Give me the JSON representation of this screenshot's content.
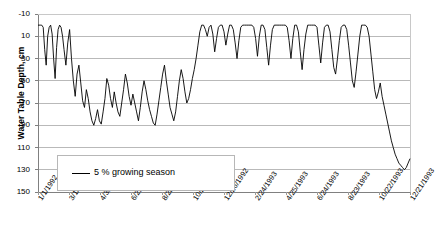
{
  "chart_data": {
    "type": "line",
    "title": "",
    "xlabel": "",
    "ylabel": "Water Table Depth, cm",
    "ylim": [
      -10,
      150
    ],
    "y_inverted": true,
    "ytick_values": [
      -10,
      10,
      30,
      50,
      70,
      90,
      110,
      130,
      150
    ],
    "ytick_labels": [
      "-10",
      "10",
      "30",
      "50",
      "70",
      "90",
      "110",
      "130",
      "150"
    ],
    "grid": "horizontal",
    "legend_position": "lower-left-inside",
    "legend": [
      {
        "name": "5 % growing season",
        "color": "#000000",
        "marker": "line"
      }
    ],
    "xtick_labels": [
      "1/1/1992",
      "3/1/1992",
      "4/30/1992",
      "6/29/1992",
      "8/28/1992",
      "10/27/1992",
      "12/26/1992",
      "2/24/1993",
      "4/25/1993",
      "6/24/1993",
      "8/23/1993",
      "10/22/1993",
      "12/21/1993"
    ],
    "x_axis_start": "1/1/1992",
    "x_axis_end": "12/21/1993",
    "x_tick_interval_days": 60,
    "series": [
      {
        "name": "5 % growing season",
        "units": "cm below surface",
        "x_fraction_values": [
          0.0,
          0.006,
          0.01,
          0.014,
          0.018,
          0.022,
          0.026,
          0.03,
          0.034,
          0.038,
          0.042,
          0.046,
          0.05,
          0.054,
          0.058,
          0.062,
          0.066,
          0.07,
          0.075,
          0.08,
          0.085,
          0.09,
          0.095,
          0.1,
          0.105,
          0.11,
          0.115,
          0.12,
          0.125,
          0.13,
          0.135,
          0.14,
          0.145,
          0.15,
          0.155,
          0.16,
          0.165,
          0.17,
          0.175,
          0.18,
          0.185,
          0.19,
          0.195,
          0.2,
          0.205,
          0.21,
          0.215,
          0.22,
          0.225,
          0.23,
          0.235,
          0.24,
          0.245,
          0.25,
          0.255,
          0.26,
          0.265,
          0.27,
          0.275,
          0.28,
          0.285,
          0.29,
          0.295,
          0.3,
          0.305,
          0.31,
          0.315,
          0.32,
          0.325,
          0.33,
          0.335,
          0.34,
          0.345,
          0.35,
          0.355,
          0.36,
          0.365,
          0.37,
          0.375,
          0.38,
          0.385,
          0.39,
          0.395,
          0.4,
          0.405,
          0.41,
          0.415,
          0.42,
          0.425,
          0.43,
          0.435,
          0.44,
          0.445,
          0.45,
          0.455,
          0.46,
          0.465,
          0.47,
          0.475,
          0.48,
          0.485,
          0.49,
          0.495,
          0.5,
          0.505,
          0.51,
          0.515,
          0.52,
          0.525,
          0.53,
          0.535,
          0.54,
          0.545,
          0.55,
          0.555,
          0.56,
          0.565,
          0.57,
          0.575,
          0.58,
          0.585,
          0.59,
          0.595,
          0.6,
          0.605,
          0.61,
          0.615,
          0.62,
          0.625,
          0.63,
          0.635,
          0.64,
          0.645,
          0.65,
          0.655,
          0.66,
          0.665,
          0.67,
          0.675,
          0.68,
          0.685,
          0.69,
          0.695,
          0.7,
          0.705,
          0.71,
          0.715,
          0.72,
          0.725,
          0.73,
          0.735,
          0.74,
          0.745,
          0.75,
          0.755,
          0.76,
          0.765,
          0.77,
          0.775,
          0.78,
          0.785,
          0.79,
          0.795,
          0.8,
          0.805,
          0.81,
          0.815,
          0.82,
          0.825,
          0.83,
          0.835,
          0.84,
          0.845,
          0.85,
          0.855,
          0.86,
          0.865,
          0.87,
          0.875,
          0.88,
          0.885,
          0.89,
          0.895,
          0.9,
          0.905,
          0.91,
          0.915,
          0.92,
          0.925,
          0.93,
          0.935,
          0.94,
          0.945,
          0.95,
          0.955,
          0.96,
          0.965,
          0.97,
          0.975,
          0.98,
          0.985,
          0.99,
          0.995,
          1.0
        ],
        "depth_values": [
          0,
          0,
          0,
          2,
          22,
          36,
          10,
          2,
          0,
          8,
          30,
          48,
          20,
          4,
          0,
          2,
          10,
          22,
          36,
          16,
          4,
          30,
          50,
          64,
          44,
          36,
          52,
          68,
          74,
          58,
          66,
          78,
          86,
          90,
          84,
          76,
          86,
          89,
          78,
          66,
          48,
          54,
          66,
          74,
          60,
          70,
          78,
          82,
          70,
          58,
          44,
          52,
          64,
          72,
          62,
          70,
          78,
          86,
          74,
          60,
          50,
          58,
          68,
          76,
          82,
          88,
          90,
          80,
          68,
          56,
          44,
          36,
          50,
          62,
          74,
          80,
          86,
          78,
          64,
          50,
          40,
          48,
          60,
          70,
          66,
          58,
          48,
          40,
          30,
          18,
          6,
          0,
          0,
          4,
          10,
          2,
          0,
          8,
          24,
          12,
          2,
          0,
          0,
          6,
          18,
          8,
          0,
          0,
          4,
          16,
          30,
          14,
          2,
          0,
          0,
          0,
          0,
          0,
          0,
          2,
          12,
          28,
          10,
          0,
          0,
          4,
          20,
          36,
          18,
          4,
          0,
          0,
          0,
          0,
          0,
          0,
          0,
          2,
          14,
          30,
          12,
          0,
          0,
          6,
          24,
          40,
          22,
          8,
          0,
          0,
          0,
          0,
          0,
          2,
          18,
          34,
          16,
          2,
          0,
          0,
          6,
          22,
          38,
          44,
          30,
          14,
          2,
          0,
          0,
          4,
          18,
          34,
          50,
          56,
          42,
          26,
          10,
          0,
          0,
          0,
          2,
          10,
          26,
          42,
          58,
          66,
          60,
          52,
          64,
          72,
          80,
          88,
          96,
          104,
          110,
          116,
          120,
          124,
          126,
          128,
          130,
          128,
          124,
          120
        ]
      }
    ],
    "description_segments": [
      {
        "period": "1/1/1992 - 3/1/1992",
        "pattern": "near surface with sharp oscillations 0 to 48 cm"
      },
      {
        "period": "3/1/1992 - 10/27/1992",
        "pattern": "sawtooth drawdown cycles between 40 and 90 cm"
      },
      {
        "period": "10/27/1992 - 4/25/1993",
        "pattern": "water table at or near surface, rapid square-wave spikes 0 to 40 cm"
      },
      {
        "period": "4/25/1993 - 8/23/1993",
        "pattern": "extended drawdown reaching maximum depth about 130 cm"
      },
      {
        "period": "8/23/1993 - 12/21/1993",
        "pattern": "sharp recovery back to near surface, ending about 0 cm"
      }
    ],
    "max_depth_cm": 130,
    "min_depth_cm": 0
  },
  "plot": {
    "left": 38,
    "top": 14,
    "right": 410,
    "bottom": 192
  },
  "legend_box": {
    "label": "5 % growing season"
  }
}
